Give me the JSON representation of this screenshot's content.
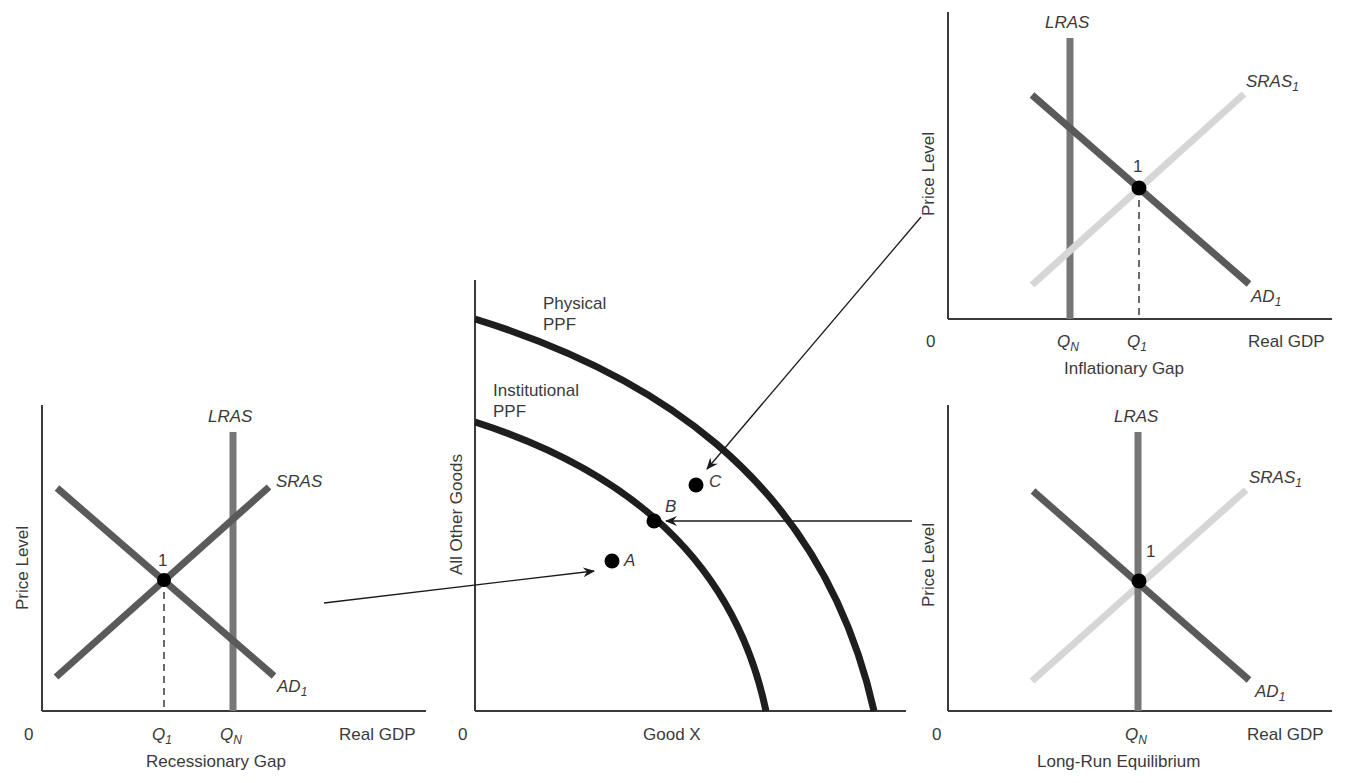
{
  "colors": {
    "axis": "#3a3a3a",
    "ad_curve": "#5a5a5a",
    "lras_curve": "#777777",
    "sras_dark": "#5a5a5a",
    "sras_light": "#d6d6d6",
    "ppf_curve": "#1e1e1e",
    "point": "#000000",
    "arrow": "#1a1a1a"
  },
  "panels": {
    "recessionary": {
      "y_label": "Price Level",
      "origin": "0",
      "x_label": "Real GDP",
      "caption": "Recessionary Gap",
      "lras": "LRAS",
      "sras": "SRAS",
      "ad_main": "AD",
      "ad_sub": "1",
      "point": "1",
      "q1_main": "Q",
      "q1_sub": "1",
      "qn_main": "Q",
      "qn_sub": "N"
    },
    "ppf": {
      "y_label": "All Other Goods",
      "origin": "0",
      "x_label": "Good X",
      "physical_line1": "Physical",
      "physical_line2": "PPF",
      "institutional_line1": "Institutional",
      "institutional_line2": "PPF",
      "point_a": "A",
      "point_b": "B",
      "point_c": "C"
    },
    "inflationary": {
      "y_label": "Price Level",
      "origin": "0",
      "x_label": "Real GDP",
      "caption": "Inflationary Gap",
      "lras": "LRAS",
      "sras_main": "SRAS",
      "sras_sub": "1",
      "ad_main": "AD",
      "ad_sub": "1",
      "point": "1",
      "qn_main": "Q",
      "qn_sub": "N",
      "q1_main": "Q",
      "q1_sub": "1"
    },
    "longrun": {
      "y_label": "Price Level",
      "origin": "0",
      "x_label": "Real GDP",
      "caption": "Long-Run Equilibrium",
      "lras": "LRAS",
      "sras_main": "SRAS",
      "sras_sub": "1",
      "ad_main": "AD",
      "ad_sub": "1",
      "point": "1",
      "qn_main": "Q",
      "qn_sub": "N"
    }
  },
  "arrows": [
    {
      "from": "Recessionary Gap",
      "to": "A"
    },
    {
      "from": "Inflationary Gap",
      "to": "C"
    },
    {
      "from": "Long-Run Equilibrium",
      "to": "B"
    }
  ]
}
